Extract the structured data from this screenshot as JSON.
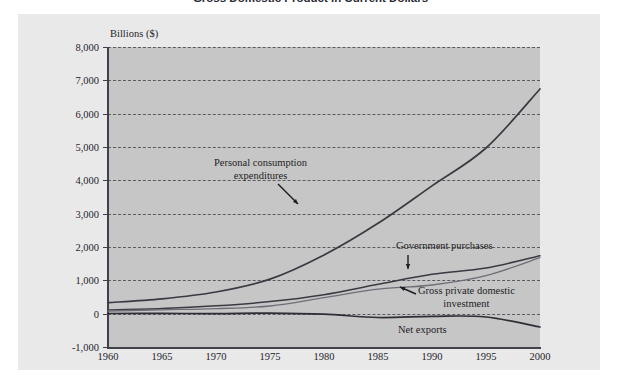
{
  "title": "Gross Domestic Product in Current Dollars",
  "axis_title": "Billions ($)",
  "y_ticks": [
    "8,000",
    "7,000",
    "6,000",
    "5,000",
    "4,000",
    "3,000",
    "2,000",
    "1,000",
    "0",
    "-1,000"
  ],
  "x_ticks": [
    "1960",
    "1965",
    "1970",
    "1975",
    "1980",
    "1985",
    "1990",
    "1995",
    "2000"
  ],
  "annotations": {
    "pce_line1": "Personal consumption",
    "pce_line2": "expenditures",
    "government": "Government purchases",
    "investment_line1": "Gross private domestic",
    "investment_line2": "investment",
    "net_exports": "Net exports"
  },
  "colors": {
    "page_background": "#ffffff",
    "figure_background": "#e9e9e9",
    "plot_background": "#c6c6c6",
    "axis": "#40404a",
    "gridline": "#5a5a62",
    "line_pce": "#3a3a42",
    "line_government": "#3a3a42",
    "line_investment": "#6e6e78",
    "line_net_exports": "#2e2e36",
    "text": "#25252c"
  },
  "chart_data": {
    "type": "line",
    "title": "Gross Domestic Product in Current Dollars",
    "xlabel": "",
    "ylabel": "Billions ($)",
    "xlim": [
      1960,
      2000
    ],
    "ylim": [
      -1000,
      8000
    ],
    "ytick_step": 1000,
    "xtick_step": 5,
    "grid": true,
    "legend": "annotated-inline",
    "x": [
      1960,
      1965,
      1970,
      1975,
      1980,
      1985,
      1990,
      1995,
      2000
    ],
    "series": [
      {
        "name": "Personal consumption expenditures",
        "values": [
          330,
          445,
          650,
          1035,
          1760,
          2710,
          3835,
          4970,
          6740
        ]
      },
      {
        "name": "Government purchases",
        "values": [
          110,
          152,
          235,
          362,
          570,
          880,
          1180,
          1370,
          1740
        ]
      },
      {
        "name": "Gross private domestic investment",
        "values": [
          80,
          116,
          152,
          230,
          480,
          735,
          860,
          1140,
          1680
        ]
      },
      {
        "name": "Net exports",
        "values": [
          5,
          7,
          4,
          16,
          -15,
          -115,
          -80,
          -100,
          -400
        ]
      }
    ]
  }
}
